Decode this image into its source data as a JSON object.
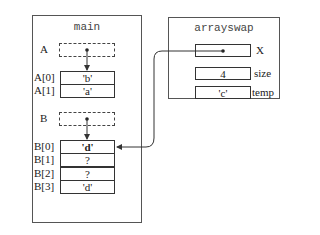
{
  "main": {
    "title": "main",
    "pointer_A": {
      "label": "A"
    },
    "array_A": [
      {
        "label": "A[0]",
        "value": "'b'"
      },
      {
        "label": "A[1]",
        "value": "'a'"
      }
    ],
    "pointer_B": {
      "label": "B"
    },
    "array_B": [
      {
        "label": "B[0]",
        "value": "'d'"
      },
      {
        "label": "B[1]",
        "value": "?"
      },
      {
        "label": "B[2]",
        "value": "?"
      },
      {
        "label": "B[3]",
        "value": "'d'"
      }
    ]
  },
  "arrayswap": {
    "title": "arrayswap",
    "vars": [
      {
        "label": "X",
        "value": ""
      },
      {
        "label": "size",
        "value": "4"
      },
      {
        "label": "temp",
        "value": "'c'"
      }
    ]
  }
}
